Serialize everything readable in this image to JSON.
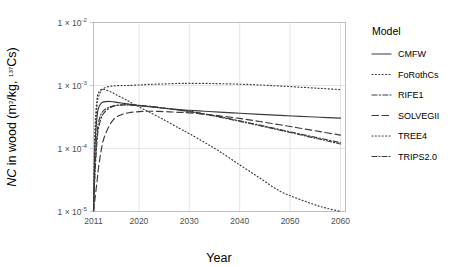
{
  "chart_data": {
    "type": "line",
    "title": "",
    "xlabel": "Year",
    "ylabel": "NC in wood (m2/kg, 137Cs)",
    "ylabel_parts": {
      "italic": "NC",
      "rest": " in wood (m",
      "sup1": "2",
      "mid": "/kg, ",
      "sup2": "137",
      "tail": "Cs)"
    },
    "xlim": [
      2011,
      2061
    ],
    "ylim": [
      1e-05,
      0.01
    ],
    "yscale": "log",
    "grid": true,
    "legend_position": "right",
    "legend_title": "Model",
    "xticks": [
      2011,
      2020,
      2030,
      2040,
      2050,
      2060
    ],
    "xtick_labels": [
      "2011",
      "2020",
      "2030",
      "2040",
      "2050",
      "2060"
    ],
    "yticks": [
      0.01,
      0.001,
      0.0001,
      1e-05
    ],
    "ytick_labels": [
      "1 x 10-2",
      "1 x 10-3",
      "1 x 10-4",
      "1 x 10-5"
    ],
    "ytick_mantissa": "1",
    "ytick_times": "×",
    "ytick_base": "10",
    "ytick_exponents": [
      "-2",
      "-3",
      "-4",
      "-5"
    ],
    "x": [
      2011,
      2011.3,
      2011.7,
      2012,
      2012.5,
      2013,
      2014,
      2015,
      2016,
      2017,
      2018,
      2020,
      2022,
      2025,
      2028,
      2030,
      2033,
      2036,
      2040,
      2044,
      2048,
      2052,
      2056,
      2060
    ],
    "series": [
      {
        "name": "CMFW",
        "dash": "none",
        "color": "#3a3a3a",
        "values": [
          1e-05,
          0.00011,
          0.00032,
          0.00044,
          0.00052,
          0.00055,
          0.00056,
          0.00055,
          0.000535,
          0.00052,
          0.000505,
          0.00048,
          0.00046,
          0.000435,
          0.000415,
          0.000405,
          0.00039,
          0.000378,
          0.000362,
          0.000348,
          0.000335,
          0.000324,
          0.000313,
          0.000303
        ]
      },
      {
        "name": "FoRothCs",
        "dash": "1,2.4",
        "color": "#3a3a3a",
        "values": [
          1e-05,
          0.00014,
          0.00048,
          0.00066,
          0.00082,
          0.0009,
          0.00096,
          0.000985,
          0.000995,
          0.001,
          0.001,
          0.00102,
          0.00104,
          0.00106,
          0.00108,
          0.00108,
          0.00108,
          0.00107,
          0.00105,
          0.00102,
          0.00098,
          0.00094,
          0.0009,
          0.00086
        ]
      },
      {
        "name": "RIFE1",
        "dash": "5,2.2,1.4,2.2",
        "color": "#3a3a3a",
        "values": [
          1e-05,
          4e-05,
          0.00013,
          0.00021,
          0.0003,
          0.00036,
          0.00043,
          0.00047,
          0.00049,
          0.000495,
          0.000495,
          0.000485,
          0.00047,
          0.00044,
          0.00041,
          0.00039,
          0.000355,
          0.00032,
          0.000275,
          0.000235,
          0.0002,
          0.00017,
          0.000145,
          0.000124
        ]
      },
      {
        "name": "SOLVEGII",
        "dash": "6.5,3.5",
        "color": "#3a3a3a",
        "values": [
          1e-05,
          1.6e-05,
          3e-05,
          5e-05,
          9e-05,
          0.00014,
          0.00022,
          0.00029,
          0.00033,
          0.000355,
          0.00037,
          0.000385,
          0.00039,
          0.000385,
          0.000375,
          0.000368,
          0.00035,
          0.00033,
          0.0003,
          0.000268,
          0.000238,
          0.00021,
          0.000185,
          0.000163
        ]
      },
      {
        "name": "TREE4",
        "dash": "1,2.4",
        "color": "#3a3a3a",
        "values": [
          1e-05,
          0.0002,
          0.0006,
          0.00076,
          0.00086,
          0.00087,
          0.00082,
          0.00075,
          0.00068,
          0.00062,
          0.00056,
          0.00046,
          0.00038,
          0.000285,
          0.00021,
          0.000172,
          0.000125,
          9e-05,
          5.5e-05,
          3.4e-05,
          2.1e-05,
          1.55e-05,
          1.2e-05,
          1e-05
        ]
      },
      {
        "name": "TRIPS2.0",
        "dash": "5,2,1,2",
        "color": "#3a3a3a",
        "values": [
          1e-05,
          5e-05,
          0.00017,
          0.00026,
          0.00035,
          0.0004,
          0.00045,
          0.000475,
          0.000485,
          0.00049,
          0.00049,
          0.00048,
          0.000465,
          0.000435,
          0.000405,
          0.000385,
          0.00035,
          0.000315,
          0.00027,
          0.00023,
          0.000195,
          0.000165,
          0.00014,
          0.000118
        ]
      }
    ]
  },
  "legend": {
    "title": "Model",
    "items": [
      {
        "label": "CMFW"
      },
      {
        "label": "FoRothCs"
      },
      {
        "label": "RIFE1"
      },
      {
        "label": "SOLVEGII"
      },
      {
        "label": "TREE4"
      },
      {
        "label": "TRIPS2.0"
      }
    ]
  }
}
